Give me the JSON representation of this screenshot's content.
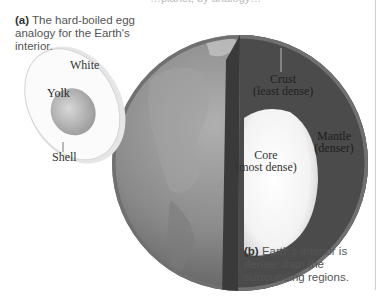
{
  "figure": {
    "top_cut_text": "…planet, by analogy…",
    "panel_a": {
      "label": "(a)",
      "caption": " The hard-boiled egg analogy for the Earth's interior.",
      "labels": {
        "white": "White",
        "yolk": "Yolk",
        "shell": "Shell"
      }
    },
    "panel_b": {
      "label": "(b)",
      "caption": " Earth's interior is denser than the surrounding regions.",
      "labels": {
        "crust": "Crust",
        "crust_note": "(least dense)",
        "mantle": "Mantle",
        "mantle_note": "(denser)",
        "core": "Core",
        "core_note": "(most dense)"
      }
    },
    "colors": {
      "background": "#ffffff",
      "globe_land": "#8a8a8a",
      "mantle": "#4a4a4a",
      "core": "#f4f4f4",
      "egg_white": "#fbfbfb",
      "yolk": "#b8b8b8"
    }
  }
}
